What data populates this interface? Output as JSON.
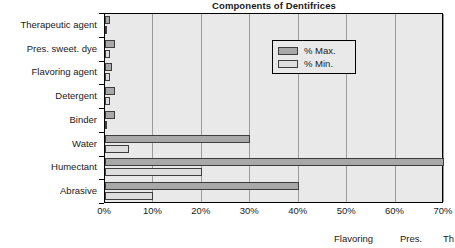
{
  "chart_data": {
    "type": "bar",
    "orientation": "horizontal",
    "title": "Components of Dentifrices",
    "xlabel": "",
    "ylabel": "",
    "xlim": [
      0,
      70
    ],
    "xtick_labels": [
      "0%",
      "10%",
      "20%",
      "30%",
      "40%",
      "50%",
      "60%",
      "70%"
    ],
    "xtick_values": [
      0,
      10,
      20,
      30,
      40,
      50,
      60,
      70
    ],
    "grid": true,
    "legend_position": "upper-right-inside",
    "categories": [
      "Therapeutic agent",
      "Pres. sweet. dye",
      "Flavoring agent",
      "Detergent",
      "Binder",
      "Water",
      "Humectant",
      "Abrasive"
    ],
    "series": [
      {
        "name": "% Max.",
        "color": "#a8a8a8",
        "values": [
          1,
          2,
          1.5,
          2,
          2,
          30,
          70,
          40
        ]
      },
      {
        "name": "% Min.",
        "color": "#dedede",
        "values": [
          0.5,
          1,
          1,
          1,
          0.5,
          5,
          20,
          10
        ]
      }
    ]
  },
  "legend": {
    "entries": [
      {
        "label": "% Max."
      },
      {
        "label": "% Min."
      }
    ]
  },
  "footer": {
    "items": [
      "Flavoring",
      "Pres.",
      "Th"
    ]
  }
}
